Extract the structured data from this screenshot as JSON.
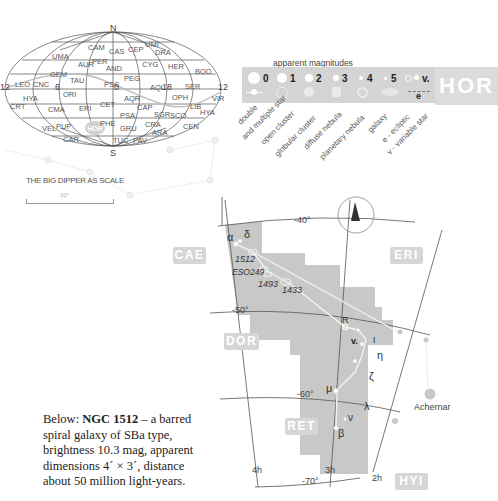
{
  "sky_map": {
    "pole_labels": {
      "north": "N",
      "south": "S"
    },
    "ra_labels": [
      "12",
      "6",
      "0",
      "18",
      "12"
    ],
    "constellations": [
      {
        "abbr": "UMA",
        "x": 52,
        "y": 52
      },
      {
        "abbr": "CAM",
        "x": 88,
        "y": 43
      },
      {
        "abbr": "CAS",
        "x": 109,
        "y": 47
      },
      {
        "abbr": "CEP",
        "x": 128,
        "y": 45
      },
      {
        "abbr": "UMI",
        "x": 145,
        "y": 40
      },
      {
        "abbr": "DRA",
        "x": 155,
        "y": 48
      },
      {
        "abbr": "AUR",
        "x": 78,
        "y": 60
      },
      {
        "abbr": "PER",
        "x": 92,
        "y": 57
      },
      {
        "abbr": "CYG",
        "x": 142,
        "y": 60
      },
      {
        "abbr": "HER",
        "x": 168,
        "y": 62
      },
      {
        "abbr": "BOO",
        "x": 195,
        "y": 67
      },
      {
        "abbr": "GEM",
        "x": 50,
        "y": 70
      },
      {
        "abbr": "AND",
        "x": 106,
        "y": 64
      },
      {
        "abbr": "PEG",
        "x": 124,
        "y": 74
      },
      {
        "abbr": "LEO",
        "x": 15,
        "y": 80
      },
      {
        "abbr": "CNC",
        "x": 33,
        "y": 80
      },
      {
        "abbr": "TAU",
        "x": 70,
        "y": 76
      },
      {
        "abbr": "PSC",
        "x": 104,
        "y": 80
      },
      {
        "abbr": "AQL",
        "x": 150,
        "y": 83
      },
      {
        "abbr": "SER",
        "x": 185,
        "y": 82
      },
      {
        "abbr": "HYA",
        "x": 23,
        "y": 94
      },
      {
        "abbr": "ORI",
        "x": 63,
        "y": 90
      },
      {
        "abbr": "AQR",
        "x": 124,
        "y": 94
      },
      {
        "abbr": "OPH",
        "x": 172,
        "y": 93
      },
      {
        "abbr": "VIR",
        "x": 212,
        "y": 94
      },
      {
        "abbr": "CRT",
        "x": 10,
        "y": 102
      },
      {
        "abbr": "CMA",
        "x": 48,
        "y": 105
      },
      {
        "abbr": "ERI",
        "x": 79,
        "y": 104
      },
      {
        "abbr": "CET",
        "x": 100,
        "y": 100
      },
      {
        "abbr": "CAP",
        "x": 137,
        "y": 103
      },
      {
        "abbr": "LIB",
        "x": 190,
        "y": 102
      },
      {
        "abbr": "HYA",
        "x": 200,
        "y": 108
      },
      {
        "abbr": "PSA",
        "x": 120,
        "y": 111
      },
      {
        "abbr": "SGR",
        "x": 154,
        "y": 110
      },
      {
        "abbr": "SCO",
        "x": 170,
        "y": 111
      },
      {
        "abbr": "PHE",
        "x": 100,
        "y": 119
      },
      {
        "abbr": "VEL",
        "x": 42,
        "y": 124
      },
      {
        "abbr": "PUP",
        "x": 56,
        "y": 122
      },
      {
        "abbr": "GRU",
        "x": 120,
        "y": 124
      },
      {
        "abbr": "CRA",
        "x": 145,
        "y": 120
      },
      {
        "abbr": "CEN",
        "x": 183,
        "y": 122
      },
      {
        "abbr": "ARA",
        "x": 152,
        "y": 128
      },
      {
        "abbr": "CAR",
        "x": 63,
        "y": 135
      },
      {
        "abbr": "TUC",
        "x": 113,
        "y": 136
      },
      {
        "abbr": "PAV",
        "x": 133,
        "y": 136
      }
    ],
    "highlight": "HOR"
  },
  "scale": {
    "title": "THE BIG DIPPER AS SCALE",
    "value": "10°"
  },
  "legend": {
    "title": "apparent magnitudes",
    "magnitudes": [
      "0",
      "1",
      "2",
      "3",
      "4",
      "5",
      "v."
    ],
    "ecliptic_marker": "e",
    "symbol_labels": [
      "double",
      "and multiple star",
      "open cluster",
      "globular cluster",
      "diffuse nebula",
      "planetary nebula",
      "galaxy",
      "e - ecliptic",
      "v - variable star"
    ],
    "constellation_badge": "HOR"
  },
  "chart": {
    "dec_labels": [
      "-40°",
      "-50°",
      "-60°",
      "-70°"
    ],
    "ra_labels": [
      "4h",
      "3h",
      "2h"
    ],
    "neighbors": [
      "CAE",
      "ERI",
      "DOR",
      "RET",
      "HYI"
    ],
    "stars": [
      {
        "label": "α"
      },
      {
        "label": "δ"
      },
      {
        "label": "R"
      },
      {
        "label": "v."
      },
      {
        "label": "ι"
      },
      {
        "label": "η"
      },
      {
        "label": "ζ"
      },
      {
        "label": "μ"
      },
      {
        "label": "λ"
      },
      {
        "label": "ν"
      },
      {
        "label": "β"
      }
    ],
    "objects": [
      "1512",
      "ESO249",
      "1493",
      "1433"
    ],
    "named_star": "Achernar",
    "colors": {
      "region": "#c8c8c8",
      "line": "#333333",
      "badge": "#d6d6d6"
    }
  },
  "caption": {
    "prefix": "Below: ",
    "object": "NGC 1512",
    "body": " – a barred spiral galaxy of SBa type, brightness 10.3 mag, apparent dimensions 4´ × 3´, distance about 50 million light-years."
  }
}
